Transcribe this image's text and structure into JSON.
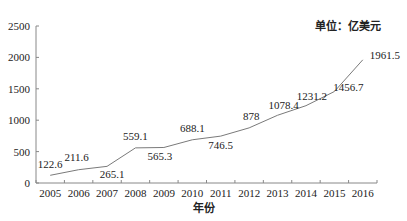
{
  "chart_data": {
    "type": "line",
    "title": "",
    "unit_label": "单位：亿美元",
    "xlabel": "年份",
    "ylabel": "",
    "categories": [
      "2005",
      "2006",
      "2007",
      "2008",
      "2009",
      "2010",
      "2011",
      "2012",
      "2013",
      "2014",
      "2015",
      "2016"
    ],
    "values": [
      122.6,
      211.6,
      265.1,
      559.1,
      565.3,
      688.1,
      746.5,
      878,
      1078.4,
      1231.2,
      1456.7,
      1961.5
    ],
    "data_labels": [
      "122.6",
      "211.6",
      "265.1",
      "559.1",
      "565.3",
      "688.1",
      "746.5",
      "878",
      "1078.4",
      "1231.2",
      "1456.7",
      "1961.5"
    ],
    "ylim": [
      0,
      2500
    ],
    "yticks": [
      0,
      500,
      1000,
      1500,
      2000,
      2500
    ],
    "grid": false,
    "legend": null,
    "line_color": "#7a7a7a"
  }
}
